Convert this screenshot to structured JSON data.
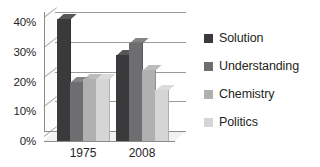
{
  "chart_data": {
    "type": "bar",
    "title": "",
    "xlabel": "",
    "ylabel": "",
    "categories": [
      "1975",
      "2008"
    ],
    "series": [
      {
        "name": "Solution",
        "values": [
          41,
          29
        ],
        "color": "#3a3a3c"
      },
      {
        "name": "Understanding",
        "values": [
          20,
          33
        ],
        "color": "#6e6e70"
      },
      {
        "name": "Chemistry",
        "values": [
          21,
          24
        ],
        "color": "#b0b0b0"
      },
      {
        "name": "Politics",
        "values": [
          21,
          17
        ],
        "color": "#d5d5d5"
      }
    ],
    "ylim": [
      0,
      40
    ],
    "ytick_labels": [
      "0%",
      "10%",
      "20%",
      "30%",
      "40%"
    ],
    "ytick_values": [
      0,
      10,
      20,
      30,
      40
    ],
    "grid": true,
    "legend_position": "right",
    "style": "3d-clustered-column"
  },
  "legend": {
    "items": [
      {
        "label": "Solution",
        "color": "#3a3a3c"
      },
      {
        "label": "Understanding",
        "color": "#6e6e70"
      },
      {
        "label": "Chemistry",
        "color": "#b0b0b0"
      },
      {
        "label": "Politics",
        "color": "#d5d5d5"
      }
    ]
  }
}
